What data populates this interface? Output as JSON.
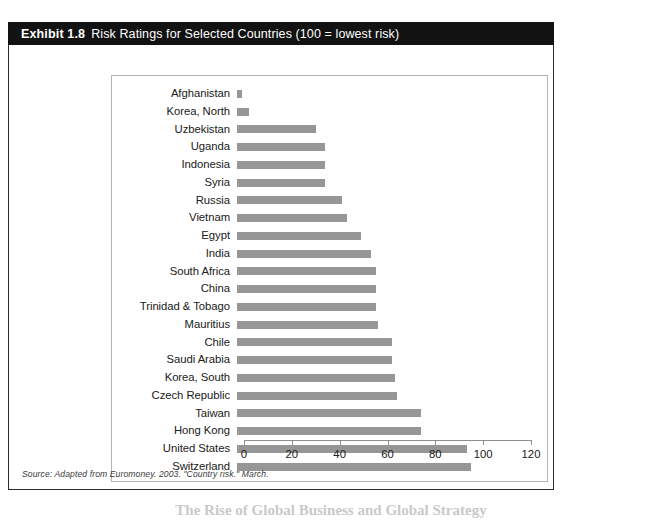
{
  "exhibit": {
    "number_label": "Exhibit 1.8",
    "title": "Risk Ratings for Selected Countries (100 = lowest risk)",
    "source_note": "Source: Adapted from Euromoney. 2003. \"Country risk.\" March.",
    "page_caption": "The Rise of Global Business and Global Strategy"
  },
  "colors": {
    "title_bar_bg": "#121212",
    "title_bar_text": "#ffffff",
    "bar_fill": "#969696",
    "panel_border": "#2b2b2b",
    "plot_border": "#b4b4b4",
    "axis_line": "#8e8e8e"
  },
  "chart_data": {
    "type": "bar",
    "orientation": "horizontal",
    "title": "Risk Ratings for Selected Countries (100 = lowest risk)",
    "xlabel": "",
    "ylabel": "",
    "xlim": [
      0,
      120
    ],
    "xticks": [
      0,
      20,
      40,
      60,
      80,
      100,
      120
    ],
    "grid": false,
    "legend": false,
    "categories": [
      "Afghanistan",
      "Korea, North",
      "Uzbekistan",
      "Uganda",
      "Indonesia",
      "Syria",
      "Russia",
      "Vietnam",
      "Egypt",
      "India",
      "South Africa",
      "China",
      "Trinidad & Tobago",
      "Mauritius",
      "Chile",
      "Saudi Arabia",
      "Korea, South",
      "Czech Republic",
      "Taiwan",
      "Hong Kong",
      "United States",
      "Switzerland"
    ],
    "values": [
      2,
      5,
      33,
      37,
      37,
      37,
      44,
      46,
      52,
      56,
      58,
      58,
      58,
      59,
      65,
      65,
      66,
      67,
      77,
      77,
      96,
      98
    ]
  }
}
